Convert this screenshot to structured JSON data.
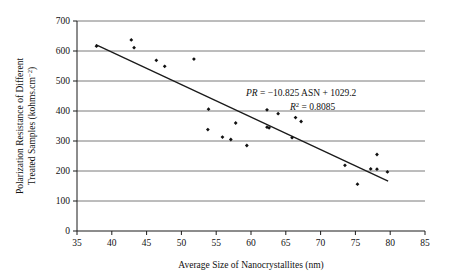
{
  "chart_data": {
    "type": "scatter",
    "title": "",
    "xlabel": "Average Size of Nanocrystallites (nm)",
    "ylabel_line1": "Polarization Resistance of Different",
    "ylabel_line2": "Treated Samples (kohms.cm",
    "ylabel_sup": "−2",
    "ylabel_line2_end": ")",
    "xlim": [
      35,
      85
    ],
    "ylim": [
      0,
      700
    ],
    "xticks": [
      35,
      40,
      45,
      50,
      55,
      60,
      65,
      70,
      75,
      80,
      85
    ],
    "yticks": [
      0,
      100,
      200,
      300,
      400,
      500,
      600,
      700
    ],
    "grid": "horizontal",
    "legend": "none",
    "marker": "small black diamond",
    "points": [
      {
        "x": 37.8,
        "y": 616
      },
      {
        "x": 42.8,
        "y": 637
      },
      {
        "x": 43.2,
        "y": 611
      },
      {
        "x": 46.4,
        "y": 569
      },
      {
        "x": 47.6,
        "y": 549
      },
      {
        "x": 51.8,
        "y": 573
      },
      {
        "x": 53.9,
        "y": 406
      },
      {
        "x": 53.8,
        "y": 338
      },
      {
        "x": 55.9,
        "y": 313
      },
      {
        "x": 57.1,
        "y": 305
      },
      {
        "x": 57.8,
        "y": 360
      },
      {
        "x": 59.4,
        "y": 285
      },
      {
        "x": 62.3,
        "y": 404
      },
      {
        "x": 62.3,
        "y": 346
      },
      {
        "x": 62.6,
        "y": 344
      },
      {
        "x": 63.9,
        "y": 391
      },
      {
        "x": 65.9,
        "y": 311
      },
      {
        "x": 66.4,
        "y": 378
      },
      {
        "x": 67.2,
        "y": 365
      },
      {
        "x": 73.5,
        "y": 219
      },
      {
        "x": 75.3,
        "y": 156
      },
      {
        "x": 77.2,
        "y": 207
      },
      {
        "x": 78.1,
        "y": 255
      },
      {
        "x": 78.1,
        "y": 206
      },
      {
        "x": 79.6,
        "y": 197
      }
    ],
    "trendline": {
      "slope": -10.825,
      "intercept": 1029.2,
      "x_start": 37.7,
      "x_end": 79.7
    },
    "annotations": {
      "equation_pr": "PR",
      "equation_body": " = −10.825 ASN + 1029.2",
      "r_squared_symbol": "R",
      "r_squared_sup": "2",
      "r_squared_value": " = 0.8085"
    }
  },
  "colors": {
    "axis": "#1a1a1a",
    "grid": "#7a7a7a",
    "marker": "#111111",
    "trendline": "#1a1a1a",
    "text": "#111111",
    "background": "#ffffff"
  }
}
